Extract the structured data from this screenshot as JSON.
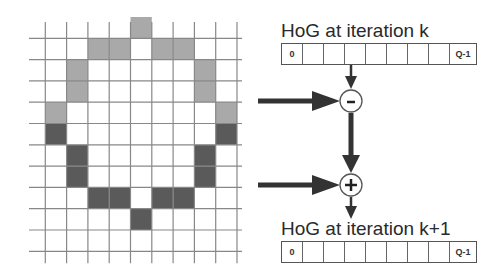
{
  "grid": {
    "cols": 10,
    "rows": 11,
    "origin_x": 24,
    "origin_y": 17,
    "cell": 21.3,
    "line_color": "#888888",
    "colors": {
      "light": "#a9a9a9",
      "dark": "#5a5a5a"
    },
    "light_cells": [
      [
        0,
        5
      ],
      [
        1,
        3
      ],
      [
        1,
        4
      ],
      [
        1,
        6
      ],
      [
        1,
        7
      ],
      [
        2,
        2
      ],
      [
        2,
        8
      ],
      [
        3,
        2
      ],
      [
        3,
        8
      ],
      [
        4,
        1
      ],
      [
        4,
        9
      ]
    ],
    "dark_cells": [
      [
        5,
        1
      ],
      [
        5,
        9
      ],
      [
        6,
        2
      ],
      [
        6,
        8
      ],
      [
        7,
        2
      ],
      [
        7,
        8
      ],
      [
        8,
        3
      ],
      [
        8,
        4
      ],
      [
        8,
        6
      ],
      [
        8,
        7
      ],
      [
        9,
        5
      ]
    ]
  },
  "histogram_top": {
    "title": "HoG at iteration k",
    "bins": [
      "0",
      "",
      "",
      "",
      "",
      "",
      "",
      "",
      "Q-1"
    ]
  },
  "histogram_bottom": {
    "title": "HoG at iteration k+1",
    "bins": [
      "0",
      "",
      "",
      "",
      "",
      "",
      "",
      "",
      "Q-1"
    ]
  },
  "operators": {
    "subtract": "-",
    "add": "+"
  }
}
